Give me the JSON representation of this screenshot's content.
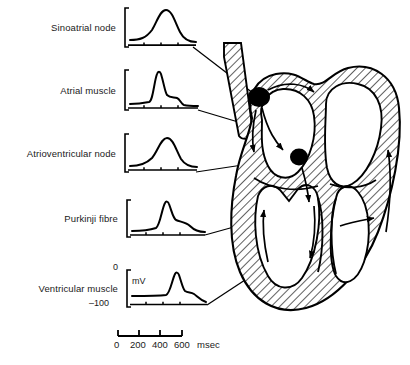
{
  "figure": {
    "ink_color": "#000000",
    "background": "#ffffff"
  },
  "traces": [
    {
      "id": "sinoatrial-node",
      "label": "Sinoatrial node",
      "shape": "slow pacemaker depolarization, rounded symmetric hump, no plateau",
      "onset_msec": 30,
      "peak_msec": 120,
      "end_msec": 260
    },
    {
      "id": "atrial-muscle",
      "label": "Atrial muscle",
      "shape": "fast upstroke, short plateau, rapid repolarization",
      "onset_msec": 90,
      "peak_msec": 120,
      "end_msec": 300
    },
    {
      "id": "atrioventricular-node",
      "label": "Atrioventricular node",
      "shape": "slow rounded depolarization, delayed",
      "onset_msec": 120,
      "peak_msec": 230,
      "end_msec": 380
    },
    {
      "id": "purkinje-fibre",
      "label": "Purkinji fibre",
      "shape": "sharp spike with sloping plateau, long repolarization",
      "onset_msec": 280,
      "peak_msec": 310,
      "end_msec": 470
    },
    {
      "id": "ventricular-muscle",
      "label": "Ventricular muscle",
      "shape": "sharp spike, sloping plateau, rapid terminal repolarization",
      "onset_msec": 370,
      "peak_msec": 400,
      "end_msec": 560
    }
  ],
  "voltage_axis": {
    "top_label": "0",
    "bottom_label": "–100",
    "unit_label": "mV",
    "range_mv": [
      -100,
      0
    ]
  },
  "time_axis": {
    "ticks": [
      "0",
      "200",
      "400",
      "600"
    ],
    "unit_label": "msec",
    "range_msec": [
      0,
      600
    ]
  },
  "heart": {
    "nodes": [
      {
        "id": "sa-node",
        "name": "sinoatrial node marker"
      },
      {
        "id": "av-node",
        "name": "atrioventricular node marker"
      }
    ],
    "wall_fill": "hatched myocardium",
    "chambers": [
      "right atrium",
      "left atrium",
      "right ventricle",
      "left ventricle"
    ],
    "conduction_arrows": 7
  }
}
